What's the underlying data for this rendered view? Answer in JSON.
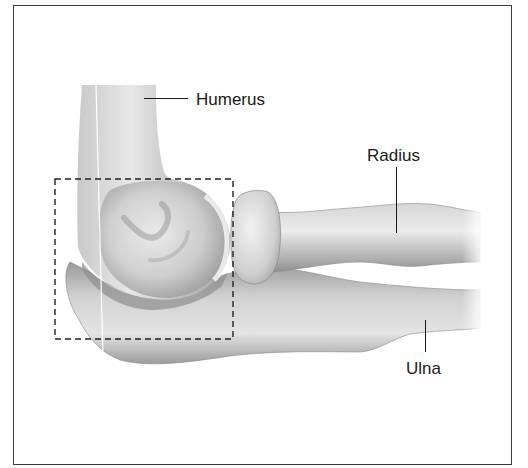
{
  "figure": {
    "labels": {
      "humerus": "Humerus",
      "radius": "Radius",
      "ulna": "Ulna"
    },
    "inset_box": {
      "style": "dashed",
      "x": 55,
      "y": 179,
      "width": 178,
      "height": 160
    },
    "colors": {
      "border": "#3a3a3a",
      "text": "#1a1a1a",
      "bone_light": "#e6e6e6",
      "bone_mid": "#b8b8b8",
      "bone_dark": "#7a7a7a"
    }
  }
}
